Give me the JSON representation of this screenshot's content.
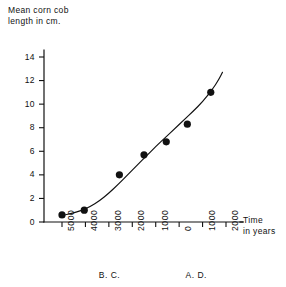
{
  "chart_data": {
    "type": "scatter",
    "title": "",
    "ylabel": "Mean corn cob\nlength in cm.",
    "xlabel": "Time\nin years",
    "xlim": [
      -5500,
      2500
    ],
    "ylim": [
      0,
      15
    ],
    "grid": false,
    "legend": "none",
    "x_tick_labels": [
      "5000",
      "4000",
      "3000",
      "2000",
      "1000",
      "0",
      "1000",
      "2000"
    ],
    "x_tick_values": [
      -5000,
      -4000,
      -3000,
      -2000,
      -1000,
      0,
      1000,
      2000
    ],
    "y_tick_labels": [
      "0",
      "2",
      "4",
      "6",
      "8",
      "10",
      "12",
      "14"
    ],
    "y_tick_values": [
      0,
      2,
      4,
      6,
      8,
      10,
      12,
      14
    ],
    "era_labels": [
      {
        "text": "B. C.",
        "x": -3000
      },
      {
        "text": "A. D.",
        "x": 700
      }
    ],
    "x_unit": "years",
    "y_unit": "cm",
    "points": [
      {
        "x": -5000,
        "y": 0.6,
        "era": "B.C."
      },
      {
        "x": -4050,
        "y": 1.0,
        "era": "B.C."
      },
      {
        "x": -2550,
        "y": 4.0,
        "era": "B.C."
      },
      {
        "x": -1500,
        "y": 5.7,
        "era": "B.C."
      },
      {
        "x": -550,
        "y": 6.8,
        "era": "B.C."
      },
      {
        "x": 350,
        "y": 8.3,
        "era": "A.D."
      },
      {
        "x": 1350,
        "y": 11.0,
        "era": "A.D."
      }
    ],
    "fit_curve": {
      "label": "fitted trend curve",
      "points": [
        {
          "x": -5000,
          "y": 0.55
        },
        {
          "x": -4600,
          "y": 0.72
        },
        {
          "x": -4200,
          "y": 0.95
        },
        {
          "x": -3800,
          "y": 1.3
        },
        {
          "x": -3400,
          "y": 1.8
        },
        {
          "x": -3000,
          "y": 2.45
        },
        {
          "x": -2600,
          "y": 3.2
        },
        {
          "x": -2200,
          "y": 4.0
        },
        {
          "x": -1800,
          "y": 4.8
        },
        {
          "x": -1400,
          "y": 5.6
        },
        {
          "x": -1000,
          "y": 6.4
        },
        {
          "x": -600,
          "y": 7.15
        },
        {
          "x": -200,
          "y": 7.9
        },
        {
          "x": 200,
          "y": 8.65
        },
        {
          "x": 600,
          "y": 9.4
        },
        {
          "x": 1000,
          "y": 10.2
        },
        {
          "x": 1400,
          "y": 11.2
        },
        {
          "x": 1700,
          "y": 12.1
        },
        {
          "x": 1850,
          "y": 12.7
        }
      ]
    }
  },
  "figure": {
    "y_axis_title": "Mean corn cob\nlength in cm.",
    "x_axis_title": "Time\nin years"
  }
}
